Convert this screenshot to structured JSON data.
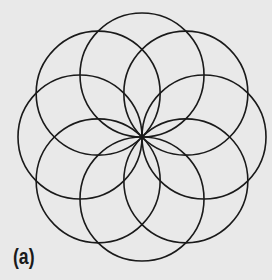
{
  "figure": {
    "label": "(a)",
    "center": [
      142,
      137
    ],
    "circle_radius": 62,
    "circle_count": 8,
    "stroke_color": "#1a1a1a",
    "background_color": "#e9e9e9"
  }
}
